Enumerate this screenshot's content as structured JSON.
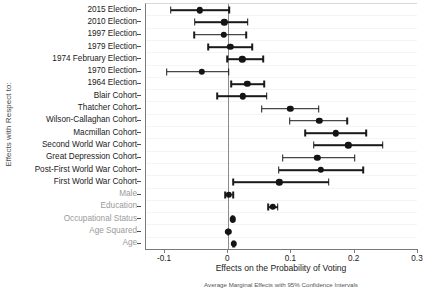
{
  "chart_data": {
    "type": "scatter",
    "plot_style": "coefficient-forest-plot",
    "title": "",
    "xlabel": "Effects on the Probability of Voting",
    "ylabel": "Effects with Respect to:",
    "note": "Average Marginal Effects with 95% Confidence Intervals",
    "xlim": [
      -0.13,
      0.3
    ],
    "xticks": [
      -0.1,
      0,
      0.1,
      0.2,
      0.3
    ],
    "xticklabels": [
      "-0.1",
      "0",
      "0.1",
      "0.2",
      "0.3"
    ],
    "reference_line": 0,
    "grid": "faint-horizontal",
    "legend": "none",
    "categories": [
      "2015 Election",
      "2010 Election",
      "1997 Election",
      "1979 Election",
      "1974 February Election",
      "1970 Election",
      "1964 Election",
      "Blair Cohort",
      "Thatcher Cohort",
      "Wilson-Callaghan Cohort",
      "Macmillan Cohort",
      "Second World War Cohort",
      "Great Depression Cohort",
      "Post-First World War Cohort",
      "First World War Cohort",
      "Male",
      "Education",
      "Occupational Status",
      "Age Squared",
      "Age"
    ],
    "dimmed_categories": [
      "Male",
      "Education",
      "Occupational Status",
      "Age Squared",
      "Age"
    ],
    "points": [
      {
        "label": "2015 Election",
        "estimate": -0.045,
        "ci_low": -0.091,
        "ci_high": 0.002
      },
      {
        "label": "2010 Election",
        "estimate": -0.006,
        "ci_low": -0.053,
        "ci_high": 0.031
      },
      {
        "label": "1997 Election",
        "estimate": -0.007,
        "ci_low": -0.054,
        "ci_high": 0.028
      },
      {
        "label": "1979 Election",
        "estimate": 0.003,
        "ci_low": -0.032,
        "ci_high": 0.038
      },
      {
        "label": "1974 February Election",
        "estimate": 0.022,
        "ci_low": -0.002,
        "ci_high": 0.055
      },
      {
        "label": "1970 Election",
        "estimate": -0.042,
        "ci_low": -0.097,
        "ci_high": 0.001
      },
      {
        "label": "1964 Election",
        "estimate": 0.03,
        "ci_low": 0.005,
        "ci_high": 0.057
      },
      {
        "label": "Blair Cohort",
        "estimate": 0.023,
        "ci_low": -0.017,
        "ci_high": 0.061
      },
      {
        "label": "Thatcher Cohort",
        "estimate": 0.098,
        "ci_low": 0.053,
        "ci_high": 0.143
      },
      {
        "label": "Wilson-Callaghan Cohort",
        "estimate": 0.144,
        "ci_low": 0.097,
        "ci_high": 0.188
      },
      {
        "label": "Macmillan Cohort",
        "estimate": 0.17,
        "ci_low": 0.122,
        "ci_high": 0.218
      },
      {
        "label": "Second World War Cohort",
        "estimate": 0.19,
        "ci_low": 0.135,
        "ci_high": 0.244
      },
      {
        "label": "Great Depression Cohort",
        "estimate": 0.141,
        "ci_low": 0.086,
        "ci_high": 0.2
      },
      {
        "label": "Post-First World War Cohort",
        "estimate": 0.146,
        "ci_low": 0.08,
        "ci_high": 0.213
      },
      {
        "label": "First World War Cohort",
        "estimate": 0.081,
        "ci_low": 0.008,
        "ci_high": 0.159
      },
      {
        "label": "Male",
        "estimate": 0.001,
        "ci_low": -0.005,
        "ci_high": 0.008
      },
      {
        "label": "Education",
        "estimate": 0.07,
        "ci_low": 0.063,
        "ci_high": 0.078
      },
      {
        "label": "Occupational Status",
        "estimate": 0.007,
        "ci_low": 0.006,
        "ci_high": 0.008
      },
      {
        "label": "Age Squared",
        "estimate": 0.0,
        "ci_low": -0.001,
        "ci_high": 0.001
      },
      {
        "label": "Age",
        "estimate": 0.009,
        "ci_low": 0.008,
        "ci_high": 0.01
      }
    ]
  }
}
